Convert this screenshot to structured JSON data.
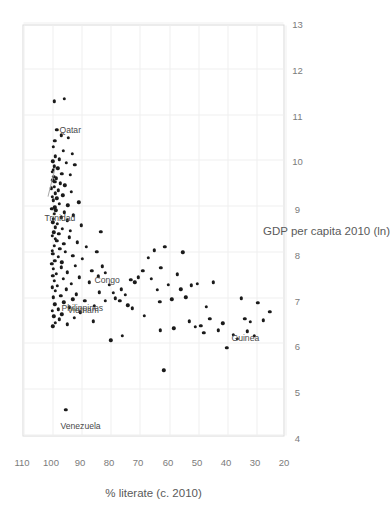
{
  "chart_data": {
    "type": "scatter",
    "title": "",
    "xlabel": "% literate (c. 2010)",
    "ylabel": "GDP per capita 2010 (ln)",
    "xticks": [
      110,
      100,
      90,
      80,
      70,
      60,
      50,
      40,
      30,
      20
    ],
    "yticks": [
      4,
      5,
      6,
      7,
      8,
      9,
      10,
      11,
      12,
      13
    ],
    "xlim": [
      110,
      20
    ],
    "ylim": [
      4,
      13
    ],
    "x_axis_reversed": true,
    "grid": true,
    "legend": null,
    "orientation": "rotated-90",
    "marker": {
      "shape": "circle",
      "color": "#1a1a1a",
      "size_px": 3.4
    },
    "point_count": 160,
    "annotations": [
      {
        "label": "Qatar",
        "x": 96.0,
        "y": 11.55,
        "leader": false
      },
      {
        "label": "Trinidad",
        "x": 99.0,
        "y": 9.9,
        "leader": true
      },
      {
        "label": "Philippines",
        "x": 95.4,
        "y": 7.1,
        "leader": false
      },
      {
        "label": "Vietnam",
        "x": 93.0,
        "y": 7.05,
        "leader": false
      },
      {
        "label": "Congo",
        "x": 83.8,
        "y": 7.75,
        "leader": false
      },
      {
        "label": "Guinea",
        "x": 41.0,
        "y": 6.45,
        "leader": false
      },
      {
        "label": "Venezuela",
        "x": 95.5,
        "y": 4.57,
        "leader": false
      }
    ],
    "points": [
      [
        99.4,
        11.3
      ],
      [
        96.0,
        11.36
      ],
      [
        98.6,
        10.68
      ],
      [
        97.0,
        10.56
      ],
      [
        99.3,
        10.44
      ],
      [
        94.6,
        10.5
      ],
      [
        99.7,
        10.31
      ],
      [
        96.3,
        10.22
      ],
      [
        93.2,
        10.16
      ],
      [
        99.1,
        10.1
      ],
      [
        97.6,
        10.04
      ],
      [
        99.9,
        9.99
      ],
      [
        95.2,
        9.96
      ],
      [
        92.4,
        9.92
      ],
      [
        99.5,
        9.88
      ],
      [
        98.2,
        9.84
      ],
      [
        99.8,
        9.8
      ],
      [
        100.2,
        9.76
      ],
      [
        96.8,
        9.72
      ],
      [
        94.0,
        9.7
      ],
      [
        99.6,
        9.66
      ],
      [
        98.8,
        9.62
      ],
      [
        100.0,
        9.58
      ],
      [
        99.2,
        9.55
      ],
      [
        97.3,
        9.51
      ],
      [
        95.8,
        9.47
      ],
      [
        99.4,
        9.43
      ],
      [
        100.4,
        9.4
      ],
      [
        98.0,
        9.36
      ],
      [
        93.6,
        9.33
      ],
      [
        99.0,
        9.29
      ],
      [
        96.5,
        9.25
      ],
      [
        100.1,
        9.21
      ],
      [
        98.5,
        9.18
      ],
      [
        99.7,
        9.14
      ],
      [
        91.0,
        9.1
      ],
      [
        97.8,
        9.07
      ],
      [
        94.8,
        9.03
      ],
      [
        99.3,
        8.99
      ],
      [
        100.3,
        8.96
      ],
      [
        98.9,
        8.92
      ],
      [
        96.0,
        8.88
      ],
      [
        99.5,
        8.85
      ],
      [
        92.8,
        8.81
      ],
      [
        97.1,
        8.77
      ],
      [
        99.8,
        8.74
      ],
      [
        95.0,
        8.7
      ],
      [
        100.0,
        8.66
      ],
      [
        98.3,
        8.63
      ],
      [
        90.2,
        8.59
      ],
      [
        99.1,
        8.55
      ],
      [
        96.7,
        8.52
      ],
      [
        93.9,
        8.48
      ],
      [
        99.6,
        8.44
      ],
      [
        97.9,
        8.41
      ],
      [
        100.2,
        8.37
      ],
      [
        94.3,
        8.33
      ],
      [
        99.0,
        8.3
      ],
      [
        98.6,
        8.26
      ],
      [
        91.6,
        8.22
      ],
      [
        96.2,
        8.19
      ],
      [
        99.4,
        8.15
      ],
      [
        88.5,
        8.12
      ],
      [
        97.5,
        8.08
      ],
      [
        100.1,
        8.04
      ],
      [
        95.6,
        8.01
      ],
      [
        99.9,
        7.97
      ],
      [
        93.0,
        7.93
      ],
      [
        98.1,
        7.9
      ],
      [
        89.8,
        7.86
      ],
      [
        99.2,
        7.82
      ],
      [
        96.9,
        7.79
      ],
      [
        100.3,
        7.75
      ],
      [
        92.2,
        7.71
      ],
      [
        97.0,
        7.68
      ],
      [
        99.7,
        7.64
      ],
      [
        86.5,
        7.6
      ],
      [
        94.9,
        7.57
      ],
      [
        98.8,
        7.53
      ],
      [
        100.0,
        7.49
      ],
      [
        90.8,
        7.46
      ],
      [
        96.4,
        7.42
      ],
      [
        99.5,
        7.38
      ],
      [
        87.3,
        7.35
      ],
      [
        93.5,
        7.31
      ],
      [
        98.4,
        7.27
      ],
      [
        100.2,
        7.24
      ],
      [
        95.4,
        7.2
      ],
      [
        99.1,
        7.16
      ],
      [
        84.0,
        7.13
      ],
      [
        91.9,
        7.09
      ],
      [
        97.2,
        7.05
      ],
      [
        99.8,
        7.02
      ],
      [
        93.0,
        6.98
      ],
      [
        88.9,
        6.94
      ],
      [
        96.1,
        6.91
      ],
      [
        99.3,
        6.87
      ],
      [
        85.6,
        6.83
      ],
      [
        94.2,
        6.8
      ],
      [
        98.0,
        6.76
      ],
      [
        100.1,
        6.72
      ],
      [
        90.4,
        6.69
      ],
      [
        96.8,
        6.65
      ],
      [
        99.6,
        6.61
      ],
      [
        92.6,
        6.58
      ],
      [
        97.7,
        6.54
      ],
      [
        86.0,
        6.5
      ],
      [
        99.0,
        6.47
      ],
      [
        95.0,
        6.43
      ],
      [
        100.0,
        6.39
      ],
      [
        83.5,
        8.45
      ],
      [
        84.8,
        8.02
      ],
      [
        82.0,
        7.55
      ],
      [
        80.6,
        7.3
      ],
      [
        79.2,
        7.12
      ],
      [
        81.8,
        6.95
      ],
      [
        84.4,
        7.48
      ],
      [
        83.0,
        7.7
      ],
      [
        78.5,
        7.0
      ],
      [
        76.4,
        7.2
      ],
      [
        75.0,
        7.08
      ],
      [
        74.2,
        6.85
      ],
      [
        76.9,
        6.95
      ],
      [
        73.1,
        7.4
      ],
      [
        71.8,
        7.35
      ],
      [
        70.5,
        7.46
      ],
      [
        72.6,
        6.78
      ],
      [
        69.0,
        7.6
      ],
      [
        67.2,
        7.88
      ],
      [
        66.0,
        7.42
      ],
      [
        68.4,
        6.62
      ],
      [
        65.1,
        8.05
      ],
      [
        64.0,
        7.18
      ],
      [
        63.2,
        6.92
      ],
      [
        61.5,
        8.12
      ],
      [
        62.8,
        7.66
      ],
      [
        60.2,
        7.3
      ],
      [
        59.0,
        6.98
      ],
      [
        58.4,
        6.34
      ],
      [
        57.1,
        7.52
      ],
      [
        56.0,
        7.2
      ],
      [
        55.3,
        8.0
      ],
      [
        54.2,
        7.02
      ],
      [
        53.0,
        6.5
      ],
      [
        52.4,
        7.28
      ],
      [
        51.0,
        6.38
      ],
      [
        50.2,
        7.32
      ],
      [
        49.1,
        6.4
      ],
      [
        48.0,
        6.25
      ],
      [
        47.2,
        6.82
      ],
      [
        46.0,
        6.55
      ],
      [
        44.8,
        7.35
      ],
      [
        43.1,
        6.3
      ],
      [
        41.5,
        6.45
      ],
      [
        40.2,
        5.92
      ],
      [
        38.0,
        6.2
      ],
      [
        36.5,
        6.12
      ],
      [
        35.1,
        7.0
      ],
      [
        34.0,
        6.55
      ],
      [
        33.2,
        6.28
      ],
      [
        32.0,
        6.48
      ],
      [
        30.8,
        6.18
      ],
      [
        29.5,
        6.9
      ],
      [
        27.6,
        6.52
      ],
      [
        25.4,
        6.7
      ],
      [
        80.0,
        6.08
      ],
      [
        76.0,
        6.18
      ],
      [
        61.8,
        5.43
      ],
      [
        95.5,
        4.57
      ],
      [
        63.0,
        6.3
      ]
    ]
  }
}
